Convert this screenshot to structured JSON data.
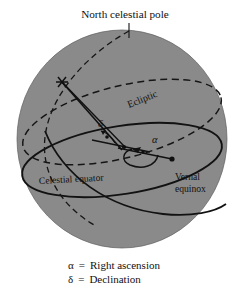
{
  "figure": {
    "title_label": "North celestial pole",
    "labels": {
      "north_celestial_pole": "North celestial pole",
      "ecliptic": "Ecliptic",
      "celestial_equator": "Celestial equator",
      "vernal_equinox_line1": "Vernal",
      "vernal_equinox_line2": "equinox",
      "alpha_symbol": "α",
      "delta_symbol": "δ"
    },
    "legend": [
      {
        "symbol": "α",
        "equals": "=",
        "text": "Right ascension"
      },
      {
        "symbol": "δ",
        "equals": "=",
        "text": "Declination"
      }
    ],
    "colors": {
      "sphere_fill": "#8a8a8a",
      "line": "#1a1a1a",
      "background": "#ffffff",
      "text": "#111111"
    },
    "geometry": {
      "sphere_center_x": 122,
      "sphere_center_y": 139,
      "sphere_radius_x": 105,
      "sphere_radius_y": 109,
      "vernal_equinox_point": "172,159",
      "star_point": "62,82",
      "pole_tick_x": 129
    }
  }
}
